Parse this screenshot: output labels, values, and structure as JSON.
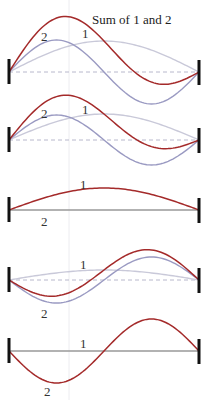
{
  "title": "Sum of 1 and 2",
  "colors": {
    "mode1": "#c9c9d9",
    "mode2": "#9a9ac2",
    "sum": "#a42a2a",
    "post": "#111111",
    "baseline_dashed": "#b8b8cc",
    "baseline_solid": "#999999",
    "guide": "#ececf0"
  },
  "string": {
    "x_start": 9,
    "x_end": 199
  },
  "panels": [
    {
      "id": "p1",
      "baseline_y": 72,
      "a1": 31,
      "a2": 32,
      "dashed": true,
      "show1": true,
      "show2": true,
      "showSum": true,
      "labels": [
        {
          "text": "2",
          "x": 41,
          "y": 41
        },
        {
          "text": "1",
          "x": 82,
          "y": 38
        }
      ]
    },
    {
      "id": "p2",
      "baseline_y": 140,
      "a1": 26,
      "a2": 25,
      "dashed": true,
      "show1": true,
      "show2": true,
      "showSum": true,
      "labels": [
        {
          "text": "2",
          "x": 41,
          "y": 118
        },
        {
          "text": "1",
          "x": 82,
          "y": 114
        }
      ]
    },
    {
      "id": "p3",
      "baseline_y": 210,
      "a1": 22,
      "a2": 0,
      "dashed": false,
      "show1": false,
      "show2": false,
      "showSum": true,
      "labels": [
        {
          "text": "1",
          "x": 80,
          "y": 189
        },
        {
          "text": "2",
          "x": 41,
          "y": 226
        }
      ]
    },
    {
      "id": "p4",
      "baseline_y": 280,
      "a1": 10,
      "a2": -23,
      "dashed": true,
      "show1": true,
      "show2": true,
      "showSum": true,
      "labels": [
        {
          "text": "1",
          "x": 80,
          "y": 269
        },
        {
          "text": "2",
          "x": 41,
          "y": 318
        }
      ]
    },
    {
      "id": "p5",
      "baseline_y": 351,
      "a1": 0,
      "a2": -32,
      "dashed": false,
      "show1": false,
      "show2": false,
      "showSum": true,
      "labels": [
        {
          "text": "1",
          "x": 80,
          "y": 348
        },
        {
          "text": "2",
          "x": 44,
          "y": 396
        }
      ]
    }
  ],
  "title_pos": {
    "x": 92,
    "y": 24
  }
}
